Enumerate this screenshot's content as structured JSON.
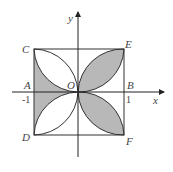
{
  "figure": {
    "labels": {
      "y_axis": "y",
      "x_axis": "x",
      "C": "C",
      "E": "E",
      "A": "A",
      "O": "O",
      "B": "B",
      "D": "D",
      "F": "F",
      "neg_one": "-1",
      "one": "1"
    },
    "colors": {
      "shade": "#b8b8b8",
      "stroke": "#333333"
    }
  }
}
